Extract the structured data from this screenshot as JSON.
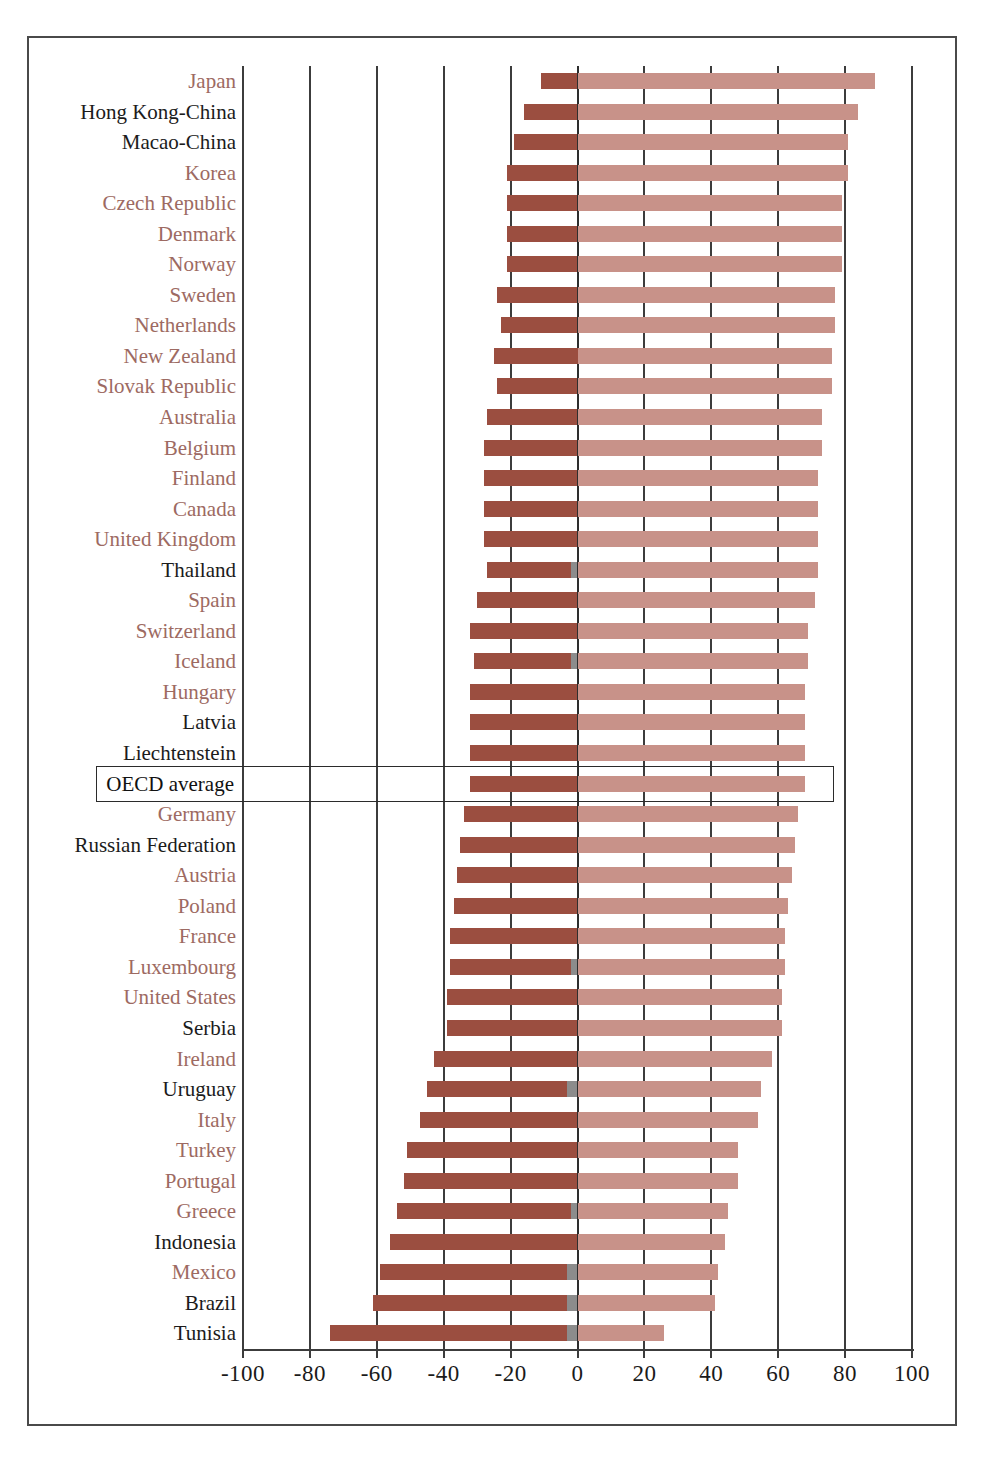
{
  "chart_data": {
    "type": "bar",
    "subtype": "diverging-stacked-horizontal",
    "title": "",
    "xlabel": "",
    "ylabel": "",
    "xlim": [
      -100,
      100
    ],
    "xticks": [
      -100,
      -80,
      -60,
      -40,
      -20,
      0,
      20,
      40,
      60,
      80,
      100
    ],
    "xticklabels": [
      "-100",
      "-80",
      "-60",
      "-40",
      "-20",
      "0",
      "20",
      "40",
      "60",
      "80",
      "100"
    ],
    "grid": true,
    "legend_position": "none",
    "series": [
      {
        "name": "negative",
        "color": "#9b4e40"
      },
      {
        "name": "neutral",
        "color": "#8c8c8c"
      },
      {
        "name": "positive",
        "color": "#c89289"
      }
    ],
    "highlighted_category": "OECD average",
    "categories": [
      "Japan",
      "Hong Kong-China",
      "Macao-China",
      "Korea",
      "Czech Republic",
      "Denmark",
      "Norway",
      "Sweden",
      "Netherlands",
      "New Zealand",
      "Slovak Republic",
      "Australia",
      "Belgium",
      "Finland",
      "Canada",
      "United Kingdom",
      "Thailand",
      "Spain",
      "Switzerland",
      "Iceland",
      "Hungary",
      "Latvia",
      "Liechtenstein",
      "OECD average",
      "Germany",
      "Russian Federation",
      "Austria",
      "Poland",
      "France",
      "Luxembourg",
      "United States",
      "Serbia",
      "Ireland",
      "Uruguay",
      "Italy",
      "Turkey",
      "Portugal",
      "Greece",
      "Indonesia",
      "Mexico",
      "Brazil",
      "Tunisia"
    ],
    "category_groups": [
      "oecd",
      "partner",
      "partner",
      "oecd",
      "oecd",
      "oecd",
      "oecd",
      "oecd",
      "oecd",
      "oecd",
      "oecd",
      "oecd",
      "oecd",
      "oecd",
      "oecd",
      "oecd",
      "partner",
      "oecd",
      "oecd",
      "oecd",
      "oecd",
      "partner",
      "partner",
      "average",
      "oecd",
      "partner",
      "oecd",
      "oecd",
      "oecd",
      "oecd",
      "oecd",
      "partner",
      "oecd",
      "partner",
      "oecd",
      "oecd",
      "oecd",
      "oecd",
      "partner",
      "oecd",
      "partner",
      "partner"
    ],
    "rows": [
      {
        "category": "Japan",
        "negative": -11,
        "neutral": 0,
        "positive": 89
      },
      {
        "category": "Hong Kong-China",
        "negative": -16,
        "neutral": 0,
        "positive": 84
      },
      {
        "category": "Macao-China",
        "negative": -19,
        "neutral": 0,
        "positive": 81
      },
      {
        "category": "Korea",
        "negative": -21,
        "neutral": 0,
        "positive": 81
      },
      {
        "category": "Czech Republic",
        "negative": -21,
        "neutral": 0,
        "positive": 79
      },
      {
        "category": "Denmark",
        "negative": -21,
        "neutral": 0,
        "positive": 79
      },
      {
        "category": "Norway",
        "negative": -21,
        "neutral": 0,
        "positive": 79
      },
      {
        "category": "Sweden",
        "negative": -24,
        "neutral": 0,
        "positive": 77
      },
      {
        "category": "Netherlands",
        "negative": -23,
        "neutral": 0,
        "positive": 77
      },
      {
        "category": "New Zealand",
        "negative": -25,
        "neutral": 0,
        "positive": 76
      },
      {
        "category": "Slovak Republic",
        "negative": -24,
        "neutral": 0,
        "positive": 76
      },
      {
        "category": "Australia",
        "negative": -27,
        "neutral": 0,
        "positive": 73
      },
      {
        "category": "Belgium",
        "negative": -28,
        "neutral": 0,
        "positive": 73
      },
      {
        "category": "Finland",
        "negative": -28,
        "neutral": 0,
        "positive": 72
      },
      {
        "category": "Canada",
        "negative": -28,
        "neutral": 0,
        "positive": 72
      },
      {
        "category": "United Kingdom",
        "negative": -28,
        "neutral": 0,
        "positive": 72
      },
      {
        "category": "Thailand",
        "negative": -27,
        "neutral": -2,
        "positive": 72
      },
      {
        "category": "Spain",
        "negative": -30,
        "neutral": 0,
        "positive": 71
      },
      {
        "category": "Switzerland",
        "negative": -32,
        "neutral": 0,
        "positive": 69
      },
      {
        "category": "Iceland",
        "negative": -31,
        "neutral": -2,
        "positive": 69
      },
      {
        "category": "Hungary",
        "negative": -32,
        "neutral": 0,
        "positive": 68
      },
      {
        "category": "Latvia",
        "negative": -32,
        "neutral": 0,
        "positive": 68
      },
      {
        "category": "Liechtenstein",
        "negative": -32,
        "neutral": 0,
        "positive": 68
      },
      {
        "category": "OECD average",
        "negative": -32,
        "neutral": 0,
        "positive": 68
      },
      {
        "category": "Germany",
        "negative": -34,
        "neutral": 0,
        "positive": 66
      },
      {
        "category": "Russian Federation",
        "negative": -35,
        "neutral": 0,
        "positive": 65
      },
      {
        "category": "Austria",
        "negative": -36,
        "neutral": 0,
        "positive": 64
      },
      {
        "category": "Poland",
        "negative": -37,
        "neutral": 0,
        "positive": 63
      },
      {
        "category": "France",
        "negative": -38,
        "neutral": 0,
        "positive": 62
      },
      {
        "category": "Luxembourg",
        "negative": -38,
        "neutral": -2,
        "positive": 62
      },
      {
        "category": "United States",
        "negative": -39,
        "neutral": 0,
        "positive": 61
      },
      {
        "category": "Serbia",
        "negative": -39,
        "neutral": 0,
        "positive": 61
      },
      {
        "category": "Ireland",
        "negative": -43,
        "neutral": 0,
        "positive": 58
      },
      {
        "category": "Uruguay",
        "negative": -45,
        "neutral": -3,
        "positive": 55
      },
      {
        "category": "Italy",
        "negative": -47,
        "neutral": 0,
        "positive": 54
      },
      {
        "category": "Turkey",
        "negative": -51,
        "neutral": 0,
        "positive": 48
      },
      {
        "category": "Portugal",
        "negative": -52,
        "neutral": 0,
        "positive": 48
      },
      {
        "category": "Greece",
        "negative": -54,
        "neutral": -2,
        "positive": 45
      },
      {
        "category": "Indonesia",
        "negative": -56,
        "neutral": 0,
        "positive": 44
      },
      {
        "category": "Mexico",
        "negative": -59,
        "neutral": -3,
        "positive": 42
      },
      {
        "category": "Brazil",
        "negative": -61,
        "neutral": -3,
        "positive": 41
      },
      {
        "category": "Tunisia",
        "negative": -74,
        "neutral": -3,
        "positive": 26
      }
    ]
  }
}
